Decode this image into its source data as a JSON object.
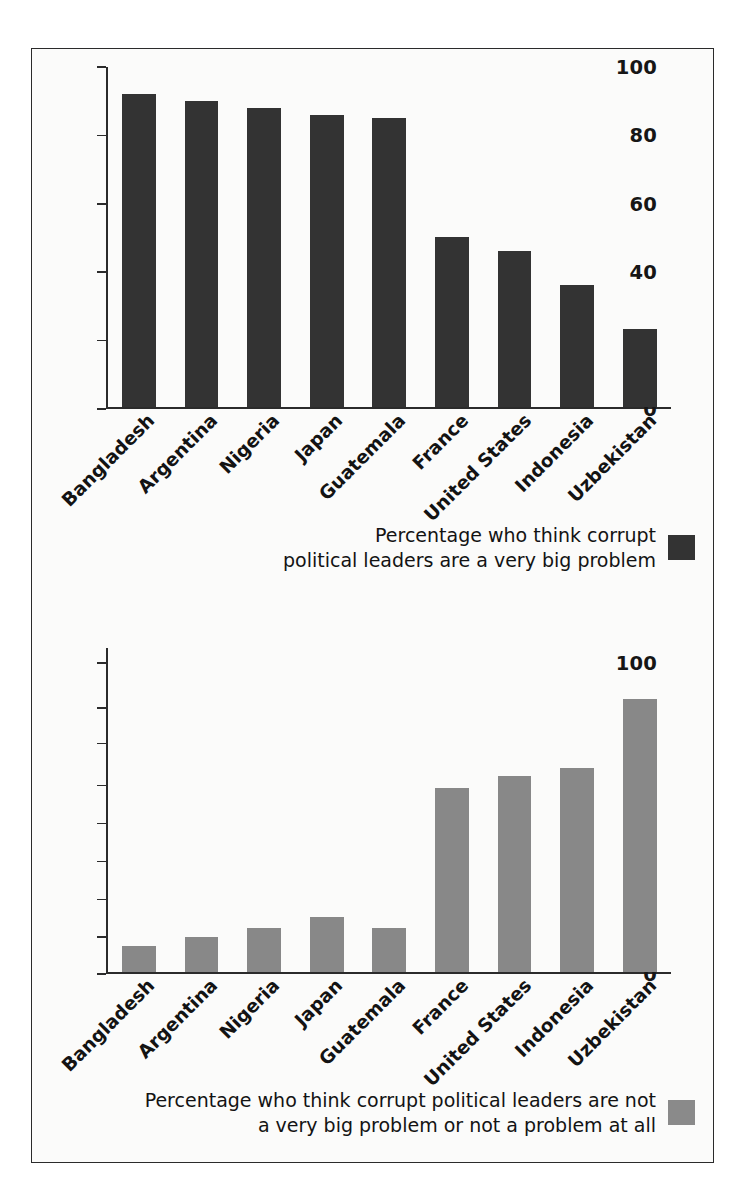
{
  "figure": {
    "background": "#fbfbfa",
    "border_color": "#2b2b2b"
  },
  "chart_data": [
    {
      "id": "top",
      "type": "bar",
      "title": "",
      "xlabel": "",
      "ylabel": "",
      "ylim": [
        0,
        100
      ],
      "grid": false,
      "legend_position": "bottom-right",
      "bar_color": "#333333",
      "categories": [
        "Bangladesh",
        "Argentina",
        "Nigeria",
        "Japan",
        "Guatemala",
        "France",
        "United States",
        "Indonesia",
        "Uzbekistan"
      ],
      "values": [
        92,
        90,
        88,
        86,
        85,
        50,
        46,
        36,
        23
      ],
      "yticks": [
        0,
        20,
        40,
        60,
        80,
        100
      ],
      "ytick_labels": [
        "0",
        "20",
        "40",
        "60",
        "80",
        "100"
      ],
      "legend": "Percentage who think corrupt\npolitical leaders are a very big problem"
    },
    {
      "id": "bottom",
      "type": "bar",
      "title": "",
      "xlabel": "",
      "ylabel": "",
      "ylim": [
        0,
        100
      ],
      "grid": false,
      "legend_position": "bottom-right",
      "bar_color": "#888888",
      "categories": [
        "Bangladesh",
        "Argentina",
        "Nigeria",
        "Japan",
        "Guatemala",
        "France",
        "United States",
        "Indonesia",
        "Uzbekistan"
      ],
      "values": [
        7,
        9.5,
        12,
        15,
        12,
        49,
        52,
        54,
        84
      ],
      "yticks": [
        0,
        10,
        20,
        30,
        40,
        50,
        60,
        80,
        100
      ],
      "ytick_labels": [
        "0",
        "10",
        "20",
        "30",
        "40",
        "50",
        "60",
        "80",
        "100"
      ],
      "ytick_positions": [
        0,
        0.1139,
        0.2281,
        0.345,
        0.462,
        0.5789,
        0.7076,
        0.8158,
        0.9532
      ],
      "legend": "Percentage who think corrupt political leaders are not\na very big problem or not a problem at all"
    }
  ]
}
